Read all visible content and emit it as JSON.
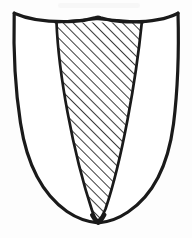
{
  "figure": {
    "name": "heraldic-shield-with-pile",
    "title": "Heraldic shield with hatched pile",
    "style": "hand-drawn ink line art, scanned page illustration",
    "background_color": "#fdfdfd",
    "ink_color": "#1a1a1a",
    "hatch_color": "#1a1a1a",
    "fill_color": "#ffffff",
    "canvas": {
      "width": 192,
      "height": 238
    },
    "outline": {
      "name": "shield-outline",
      "stroke_width": 3.2,
      "top_left": [
        14,
        13
      ],
      "top_right": [
        178,
        13
      ],
      "base_point": [
        98,
        222
      ],
      "chief_dip_y": 21,
      "chief_notch_y": 18
    },
    "charge": {
      "name": "pile",
      "blazon_term": "pile",
      "hatched": true,
      "top_left": [
        56,
        22
      ],
      "top_right": [
        142,
        22
      ],
      "apex": [
        98,
        220
      ],
      "stroke_width": 2.6
    },
    "hatching": {
      "name": "diagonal-hatch",
      "angle_degrees": 45,
      "direction": "lower-left to upper-right",
      "spacing_px": 7,
      "line_width_px": 1.6,
      "color": "#1a1a1a"
    }
  }
}
